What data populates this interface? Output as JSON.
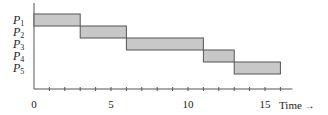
{
  "chart_data": {
    "type": "gantt",
    "title": "",
    "xlabel": "Time",
    "ylabel": "",
    "xlim": [
      0,
      16
    ],
    "x_ticks": [
      0,
      5,
      10,
      15
    ],
    "x_minor_step": 1,
    "grid": false,
    "categories": [
      "P1",
      "P2",
      "P3",
      "P4",
      "P5"
    ],
    "series": [
      {
        "name": "P1",
        "start": 0,
        "end": 3
      },
      {
        "name": "P2",
        "start": 3,
        "end": 6
      },
      {
        "name": "P3",
        "start": 6,
        "end": 11
      },
      {
        "name": "P4",
        "start": 11,
        "end": 13
      },
      {
        "name": "P5",
        "start": 13,
        "end": 16
      }
    ],
    "bar_fill": "#c8c8c8",
    "bar_stroke": "#555555"
  },
  "labels": {
    "processes": [
      {
        "base": "P",
        "sub": "1"
      },
      {
        "base": "P",
        "sub": "2"
      },
      {
        "base": "P",
        "sub": "3"
      },
      {
        "base": "P",
        "sub": "4"
      },
      {
        "base": "P",
        "sub": "5"
      }
    ],
    "ticks": [
      "0",
      "5",
      "10",
      "15"
    ],
    "xlabel": "Time"
  }
}
